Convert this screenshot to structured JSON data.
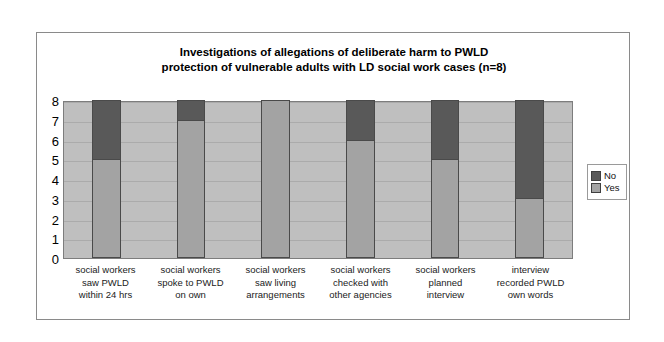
{
  "chart_data": {
    "type": "bar",
    "subtype": "stacked-column",
    "title": "Investigations of allegations of deliberate harm to PWLD protection of vulnerable adults with LD social work cases (n=8)",
    "title_lines": [
      "Investigations of allegations of deliberate harm to PWLD",
      "protection of vulnerable adults with LD social work cases (n=8)"
    ],
    "xlabel": "",
    "ylabel": "",
    "ylim": [
      0,
      8
    ],
    "yticks": [
      8,
      7,
      6,
      5,
      4,
      3,
      2,
      1,
      0
    ],
    "grid": true,
    "legend_position": "right",
    "categories": [
      "social workers saw PWLD within 24 hrs",
      "social workers spoke to PWLD on own",
      "social workers saw living arrangements",
      "social workers checked with other agencies",
      "social workers planned interview",
      "interview recorded PWLD own words"
    ],
    "category_lines": [
      [
        "social workers",
        "saw PWLD",
        "within 24 hrs"
      ],
      [
        "social workers",
        "spoke to PWLD",
        "on own"
      ],
      [
        "social workers",
        "saw living",
        "arrangements"
      ],
      [
        "social workers",
        "checked with",
        "other agencies"
      ],
      [
        "social workers",
        "planned",
        "interview"
      ],
      [
        "interview",
        "recorded PWLD",
        "own words"
      ]
    ],
    "series": [
      {
        "name": "No",
        "color": "#595959",
        "values": [
          3,
          1,
          0,
          2,
          3,
          5
        ]
      },
      {
        "name": "Yes",
        "color": "#a3a3a3",
        "values": [
          5,
          7,
          8,
          6,
          5,
          3
        ]
      }
    ],
    "stack_total": 8,
    "plot_background": "#bfbfbf",
    "frame_border": "#8a8a8a"
  },
  "legend": {
    "entries": [
      {
        "label": "No"
      },
      {
        "label": "Yes"
      }
    ]
  }
}
